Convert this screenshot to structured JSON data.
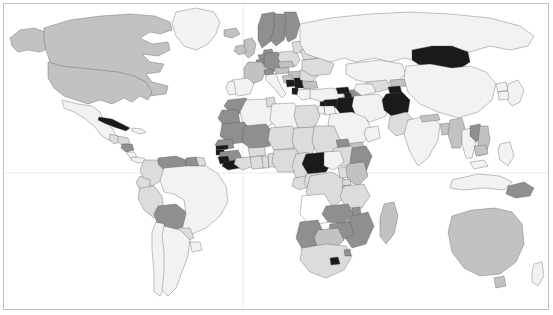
{
  "figure": {
    "type": "choropleth-world-map",
    "projection": "equirectangular",
    "background_color": "#ffffff",
    "frame_color": "#bfbfbf",
    "border_color": "#4d4d4d",
    "graticule_color": "#e2e2e2",
    "width": 553,
    "height": 315
  },
  "legend": {
    "visible": false,
    "scale_type": "sequential-grayscale-5",
    "classes": [
      {
        "key": "no_data",
        "label": "No data",
        "color": "#ffffff"
      },
      {
        "key": "very_low",
        "label": "Very low",
        "color": "#f2f2f2"
      },
      {
        "key": "low",
        "label": "Low",
        "color": "#dcdcdc"
      },
      {
        "key": "medium",
        "label": "Medium",
        "color": "#c2c2c2"
      },
      {
        "key": "high",
        "label": "High",
        "color": "#8f8f8f"
      },
      {
        "key": "very_high",
        "label": "Very high",
        "color": "#1a1a1a"
      }
    ]
  },
  "graticules": {
    "prime_meridian_x": 243,
    "equator_y": 173
  },
  "chart_data": {
    "type": "heatmap",
    "title": "",
    "subtitle": "",
    "xlabel": "",
    "ylabel": "",
    "legend_position": "none",
    "grid": true,
    "value_classes": [
      "no_data",
      "very_low",
      "low",
      "medium",
      "high",
      "very_high"
    ],
    "class_colors": {
      "no_data": "#ffffff",
      "very_low": "#f2f2f2",
      "low": "#dcdcdc",
      "medium": "#c2c2c2",
      "high": "#8f8f8f",
      "very_high": "#1a1a1a"
    },
    "regions": [
      {
        "name": "Canada",
        "class": "medium"
      },
      {
        "name": "United States",
        "class": "medium"
      },
      {
        "name": "Greenland",
        "class": "very_low"
      },
      {
        "name": "Alaska",
        "class": "medium"
      },
      {
        "name": "Mexico",
        "class": "very_low"
      },
      {
        "name": "Cuba",
        "class": "very_high"
      },
      {
        "name": "Guatemala",
        "class": "low"
      },
      {
        "name": "Honduras",
        "class": "low"
      },
      {
        "name": "Nicaragua",
        "class": "high"
      },
      {
        "name": "Costa Rica",
        "class": "very_low"
      },
      {
        "name": "Panama",
        "class": "very_low"
      },
      {
        "name": "Colombia",
        "class": "low"
      },
      {
        "name": "Venezuela",
        "class": "high"
      },
      {
        "name": "Guyana",
        "class": "high"
      },
      {
        "name": "Suriname",
        "class": "low"
      },
      {
        "name": "Ecuador",
        "class": "low"
      },
      {
        "name": "Peru",
        "class": "low"
      },
      {
        "name": "Bolivia",
        "class": "high"
      },
      {
        "name": "Brazil",
        "class": "very_low"
      },
      {
        "name": "Paraguay",
        "class": "low"
      },
      {
        "name": "Chile",
        "class": "very_low"
      },
      {
        "name": "Argentina",
        "class": "very_low"
      },
      {
        "name": "Uruguay",
        "class": "very_low"
      },
      {
        "name": "Iceland",
        "class": "medium"
      },
      {
        "name": "Norway",
        "class": "high"
      },
      {
        "name": "Sweden",
        "class": "high"
      },
      {
        "name": "Finland",
        "class": "high"
      },
      {
        "name": "United Kingdom",
        "class": "medium"
      },
      {
        "name": "Ireland",
        "class": "medium"
      },
      {
        "name": "Denmark",
        "class": "high"
      },
      {
        "name": "Germany",
        "class": "high"
      },
      {
        "name": "Netherlands",
        "class": "high"
      },
      {
        "name": "Belgium",
        "class": "high"
      },
      {
        "name": "France",
        "class": "medium"
      },
      {
        "name": "Spain",
        "class": "very_low"
      },
      {
        "name": "Portugal",
        "class": "very_low"
      },
      {
        "name": "Italy",
        "class": "very_low"
      },
      {
        "name": "Switzerland",
        "class": "high"
      },
      {
        "name": "Austria",
        "class": "medium"
      },
      {
        "name": "Poland",
        "class": "low"
      },
      {
        "name": "Czechia",
        "class": "medium"
      },
      {
        "name": "Hungary",
        "class": "medium"
      },
      {
        "name": "Romania",
        "class": "low"
      },
      {
        "name": "Bulgaria",
        "class": "medium"
      },
      {
        "name": "Serbia",
        "class": "very_high"
      },
      {
        "name": "Bosnia and Herzegovina",
        "class": "very_high"
      },
      {
        "name": "Croatia",
        "class": "medium"
      },
      {
        "name": "Albania",
        "class": "very_high"
      },
      {
        "name": "Greece",
        "class": "very_low"
      },
      {
        "name": "Turkey",
        "class": "very_low"
      },
      {
        "name": "Ukraine",
        "class": "low"
      },
      {
        "name": "Belarus",
        "class": "low"
      },
      {
        "name": "Baltic States",
        "class": "low"
      },
      {
        "name": "Russia",
        "class": "very_low"
      },
      {
        "name": "Georgia",
        "class": "very_high"
      },
      {
        "name": "Armenia",
        "class": "very_high"
      },
      {
        "name": "Azerbaijan",
        "class": "high"
      },
      {
        "name": "Kazakhstan",
        "class": "very_low"
      },
      {
        "name": "Uzbekistan",
        "class": "low"
      },
      {
        "name": "Turkmenistan",
        "class": "very_low"
      },
      {
        "name": "Kyrgyzstan",
        "class": "medium"
      },
      {
        "name": "Tajikistan",
        "class": "very_high"
      },
      {
        "name": "Afghanistan",
        "class": "very_high"
      },
      {
        "name": "Pakistan",
        "class": "low"
      },
      {
        "name": "Iran",
        "class": "very_low"
      },
      {
        "name": "Iraq",
        "class": "very_high"
      },
      {
        "name": "Syria",
        "class": "very_high"
      },
      {
        "name": "Jordan",
        "class": "very_low"
      },
      {
        "name": "Israel",
        "class": "very_low"
      },
      {
        "name": "Lebanon",
        "class": "very_high"
      },
      {
        "name": "Saudi Arabia",
        "class": "very_low"
      },
      {
        "name": "Yemen",
        "class": "medium"
      },
      {
        "name": "Oman",
        "class": "very_low"
      },
      {
        "name": "India",
        "class": "very_low"
      },
      {
        "name": "Nepal",
        "class": "medium"
      },
      {
        "name": "Bangladesh",
        "class": "medium"
      },
      {
        "name": "Myanmar",
        "class": "medium"
      },
      {
        "name": "Thailand",
        "class": "very_low"
      },
      {
        "name": "Laos",
        "class": "high"
      },
      {
        "name": "Vietnam",
        "class": "medium"
      },
      {
        "name": "Cambodia",
        "class": "medium"
      },
      {
        "name": "Malaysia",
        "class": "very_low"
      },
      {
        "name": "Indonesia",
        "class": "very_low"
      },
      {
        "name": "Philippines",
        "class": "very_low"
      },
      {
        "name": "China",
        "class": "very_low"
      },
      {
        "name": "Mongolia",
        "class": "very_high"
      },
      {
        "name": "Japan",
        "class": "very_low"
      },
      {
        "name": "North Korea",
        "class": "very_low"
      },
      {
        "name": "South Korea",
        "class": "very_low"
      },
      {
        "name": "Papua New Guinea",
        "class": "high"
      },
      {
        "name": "Australia",
        "class": "medium"
      },
      {
        "name": "New Zealand",
        "class": "very_low"
      },
      {
        "name": "Morocco",
        "class": "high"
      },
      {
        "name": "Algeria",
        "class": "very_low"
      },
      {
        "name": "Tunisia",
        "class": "low"
      },
      {
        "name": "Libya",
        "class": "very_low"
      },
      {
        "name": "Egypt",
        "class": "low"
      },
      {
        "name": "Western Sahara",
        "class": "high"
      },
      {
        "name": "Mauritania",
        "class": "high"
      },
      {
        "name": "Mali",
        "class": "high"
      },
      {
        "name": "Niger",
        "class": "low"
      },
      {
        "name": "Chad",
        "class": "low"
      },
      {
        "name": "Sudan",
        "class": "low"
      },
      {
        "name": "Eritrea",
        "class": "high"
      },
      {
        "name": "Ethiopia",
        "class": "low"
      },
      {
        "name": "Somalia",
        "class": "high"
      },
      {
        "name": "Senegal",
        "class": "high"
      },
      {
        "name": "Gambia",
        "class": "very_high"
      },
      {
        "name": "Guinea-Bissau",
        "class": "very_high"
      },
      {
        "name": "Guinea",
        "class": "high"
      },
      {
        "name": "Sierra Leone",
        "class": "very_high"
      },
      {
        "name": "Liberia",
        "class": "very_high"
      },
      {
        "name": "Ivory Coast",
        "class": "low"
      },
      {
        "name": "Ghana",
        "class": "low"
      },
      {
        "name": "Togo",
        "class": "low"
      },
      {
        "name": "Benin",
        "class": "low"
      },
      {
        "name": "Burkina Faso",
        "class": "low"
      },
      {
        "name": "Nigeria",
        "class": "low"
      },
      {
        "name": "Cameroon",
        "class": "low"
      },
      {
        "name": "Central African Republic",
        "class": "very_high"
      },
      {
        "name": "South Sudan",
        "class": "very_low"
      },
      {
        "name": "Democratic Republic of the Congo",
        "class": "low"
      },
      {
        "name": "Republic of the Congo",
        "class": "low"
      },
      {
        "name": "Gabon",
        "class": "low"
      },
      {
        "name": "Uganda",
        "class": "low"
      },
      {
        "name": "Kenya",
        "class": "medium"
      },
      {
        "name": "Tanzania",
        "class": "low"
      },
      {
        "name": "Rwanda",
        "class": "low"
      },
      {
        "name": "Burundi",
        "class": "low"
      },
      {
        "name": "Angola",
        "class": "no_data"
      },
      {
        "name": "Zambia",
        "class": "high"
      },
      {
        "name": "Zimbabwe",
        "class": "high"
      },
      {
        "name": "Mozambique",
        "class": "high"
      },
      {
        "name": "Malawi",
        "class": "high"
      },
      {
        "name": "Madagascar",
        "class": "medium"
      },
      {
        "name": "Namibia",
        "class": "high"
      },
      {
        "name": "Botswana",
        "class": "medium"
      },
      {
        "name": "South Africa",
        "class": "low"
      },
      {
        "name": "Lesotho",
        "class": "very_high"
      },
      {
        "name": "Eswatini",
        "class": "high"
      }
    ]
  }
}
